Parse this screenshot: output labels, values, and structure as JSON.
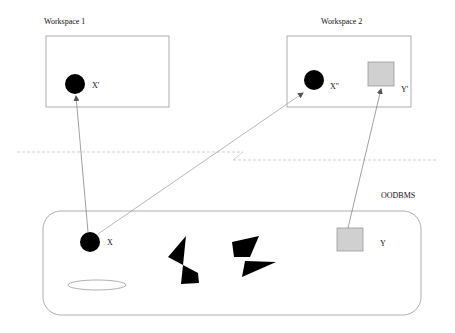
{
  "diagram": {
    "workspace1": {
      "title": "Workspace 1",
      "object_label": "X'"
    },
    "workspace2": {
      "title": "Workspace 2",
      "object_x_label": "X''",
      "object_y_label": "Y'"
    },
    "oodbms": {
      "title": "OODBMS",
      "object_x_label": "X",
      "object_y_label": "Y"
    },
    "colors": {
      "stroke": "#9a9a9a",
      "object_fill": "#000000",
      "square_fill": "#d0d0d0",
      "text": "#111111"
    },
    "arrows": [
      {
        "from": "X",
        "to": "X'"
      },
      {
        "from": "X",
        "to": "X''"
      },
      {
        "from": "Y",
        "to": "Y'"
      }
    ]
  }
}
